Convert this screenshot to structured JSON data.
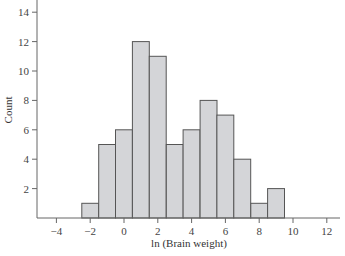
{
  "chart_data": {
    "type": "bar",
    "title": "",
    "xlabel": "ln (Brain weight)",
    "ylabel": "Count",
    "bin_width": 1,
    "bin_centers": [
      -2,
      -1,
      0,
      1,
      2,
      3,
      4,
      5,
      6,
      7,
      8,
      9
    ],
    "categories": [
      "-2.5 to -1.5",
      "-1.5 to -0.5",
      "-0.5 to 0.5",
      "0.5 to 1.5",
      "1.5 to 2.5",
      "2.5 to 3.5",
      "3.5 to 4.5",
      "4.5 to 5.5",
      "5.5 to 6.5",
      "6.5 to 7.5",
      "7.5 to 8.5",
      "8.5 to 9.5"
    ],
    "values": [
      1,
      5,
      6,
      12,
      11,
      5,
      6,
      8,
      7,
      4,
      1,
      2
    ],
    "xlim": [
      -5,
      12.8
    ],
    "ylim": [
      0,
      14.5
    ],
    "xticks": [
      -4,
      -2,
      0,
      2,
      4,
      6,
      8,
      10,
      12
    ],
    "xtick_labels": [
      "−4",
      "−2",
      "0",
      "2",
      "4",
      "6",
      "8",
      "10",
      "12"
    ],
    "yticks": [
      2,
      4,
      6,
      8,
      10,
      12,
      14
    ],
    "ytick_labels": [
      "2",
      "4",
      "6",
      "8",
      "10",
      "12",
      "14"
    ],
    "grid": false,
    "legend": null,
    "colors": {
      "bar_fill": "#d4d5d8",
      "bar_edge": "#555555",
      "axis": "#666666"
    }
  }
}
